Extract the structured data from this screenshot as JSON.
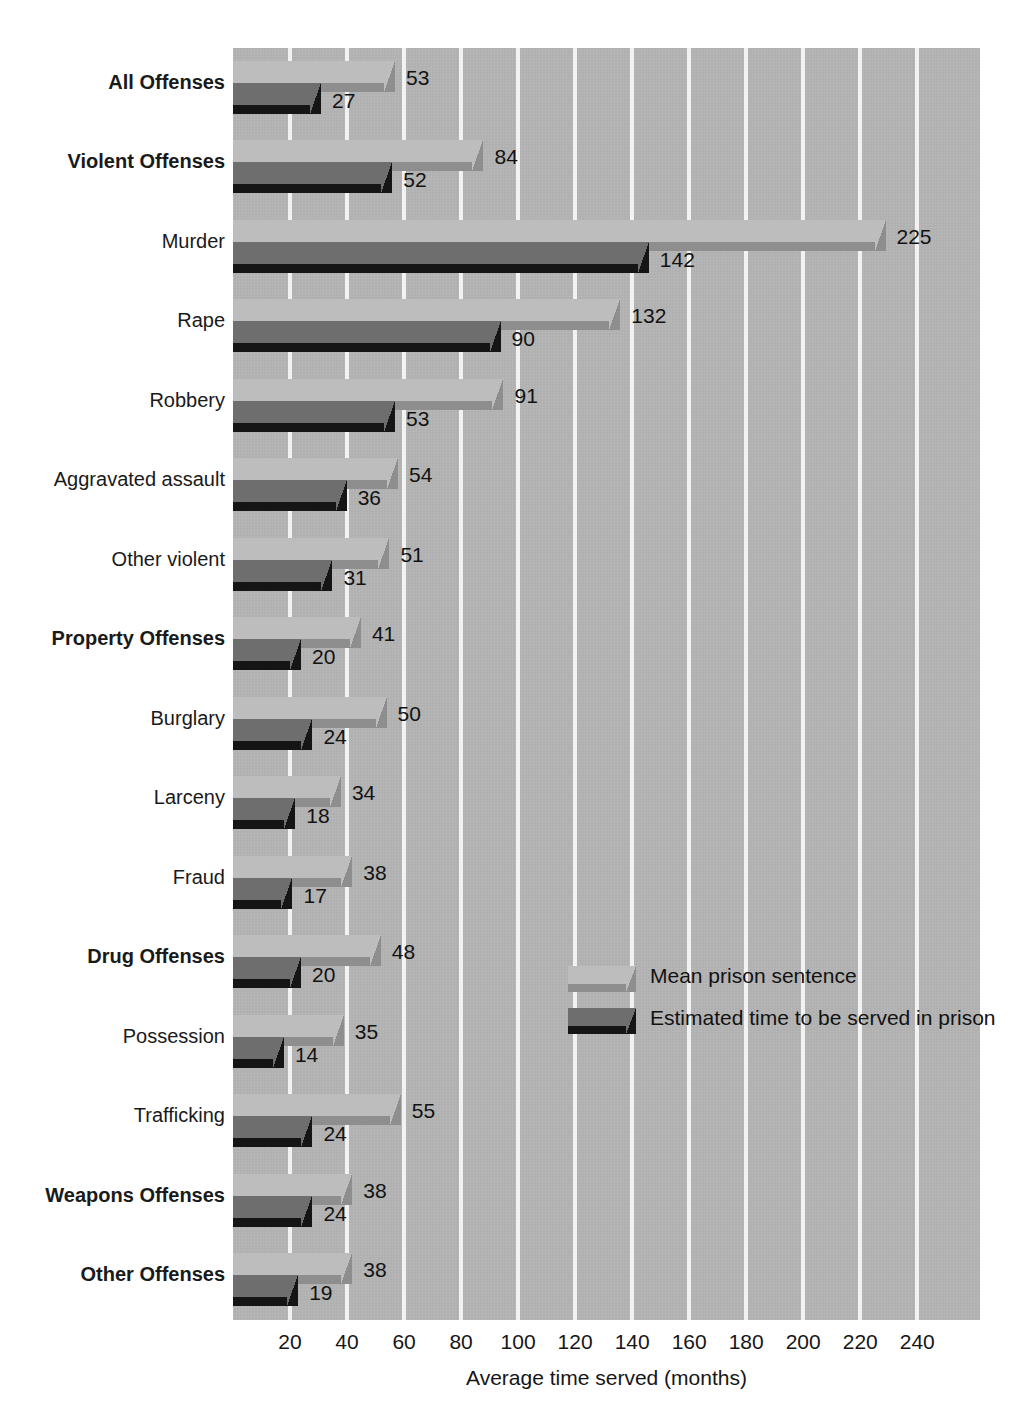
{
  "chart_data": {
    "type": "bar",
    "orientation": "horizontal",
    "title": "",
    "xlabel": "Average time served (months)",
    "ylabel": "",
    "xlim": [
      0,
      262
    ],
    "xticks": [
      20,
      40,
      60,
      80,
      100,
      120,
      140,
      160,
      180,
      200,
      220,
      240
    ],
    "grid": true,
    "legend_position": "middle-right",
    "categories": [
      "All Offenses",
      "Violent Offenses",
      "Murder",
      "Rape",
      "Robbery",
      "Aggravated assault",
      "Other violent",
      "Property Offenses",
      "Burglary",
      "Larceny",
      "Fraud",
      "Drug Offenses",
      "Possession",
      "Trafficking",
      "Weapons Offenses",
      "Other Offenses"
    ],
    "category_emphasis": [
      true,
      true,
      false,
      false,
      false,
      false,
      false,
      true,
      false,
      false,
      false,
      true,
      false,
      false,
      true,
      true
    ],
    "series": [
      {
        "name": "Mean prison sentence",
        "color": "#bdbdbd",
        "values": [
          53,
          84,
          225,
          132,
          91,
          54,
          51,
          41,
          50,
          34,
          38,
          48,
          35,
          55,
          38,
          38
        ]
      },
      {
        "name": "Estimated time to be served in prison",
        "color": "#6e6e6e",
        "values": [
          27,
          52,
          142,
          90,
          53,
          36,
          31,
          20,
          24,
          18,
          17,
          20,
          14,
          24,
          24,
          19
        ]
      }
    ]
  },
  "legend": {
    "entries": [
      {
        "label": "Mean prison sentence",
        "style": "light"
      },
      {
        "label": "Estimated time to be served in prison",
        "style": "dark"
      }
    ]
  },
  "colors": {
    "plot_background": "#b0b0b0",
    "gridline": "#f2f2f2",
    "light_bar_face": "#bdbdbd",
    "light_bar_bevel": "#8e8e8e",
    "dark_bar_face": "#6e6e6e",
    "dark_bar_bevel": "#151515",
    "text": "#121212"
  }
}
